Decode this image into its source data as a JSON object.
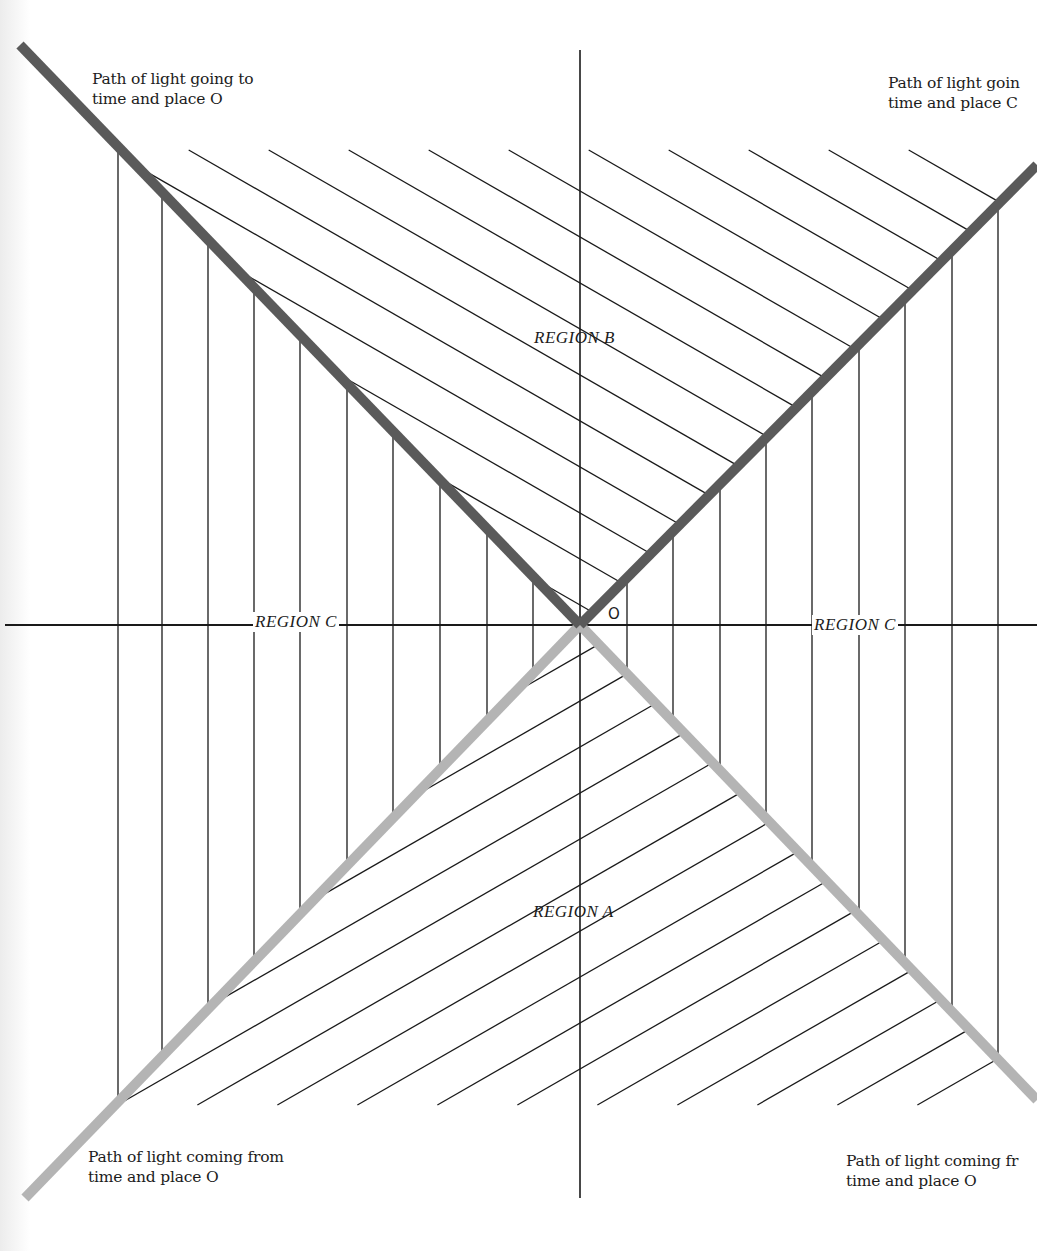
{
  "diagram": {
    "origin_label": "O",
    "regions": {
      "future": "REGION  B",
      "past": "REGION  A",
      "elsewhere_left": "REGION  C",
      "elsewhere_right": "REGION  C"
    },
    "captions": {
      "top_left": "Path of light going to\ntime and place O",
      "top_right": "Path of light goin\ntime and place C",
      "bottom_left": "Path of light coming from\ntime and place O",
      "bottom_right": "Path of light coming fr\ntime and place O"
    },
    "colors": {
      "future_light_path": "#5a5a5a",
      "past_light_path": "#b4b4b4",
      "axis": "#1a1a1a",
      "hatch": "#1a1a1a",
      "background": "#ffffff"
    },
    "geometry": {
      "origin": [
        580,
        625
      ],
      "horizontal_axis": {
        "x1": 5,
        "x2": 1037,
        "y": 625
      },
      "vertical_axis": {
        "x": 580,
        "y1": 50,
        "y2": 1198
      },
      "future_light_left_end": [
        20,
        45
      ],
      "future_light_right_end": [
        1037,
        165
      ],
      "past_light_left_end": [
        25,
        1198
      ],
      "past_light_right_end": [
        1037,
        1100
      ],
      "region_c_vertical_hatch_x_left": [
        118,
        162,
        208,
        254,
        300,
        347,
        393,
        440,
        487,
        533
      ],
      "region_c_vertical_hatch_x_right": [
        627,
        673,
        720,
        766,
        812,
        859,
        905,
        952,
        998
      ]
    }
  }
}
